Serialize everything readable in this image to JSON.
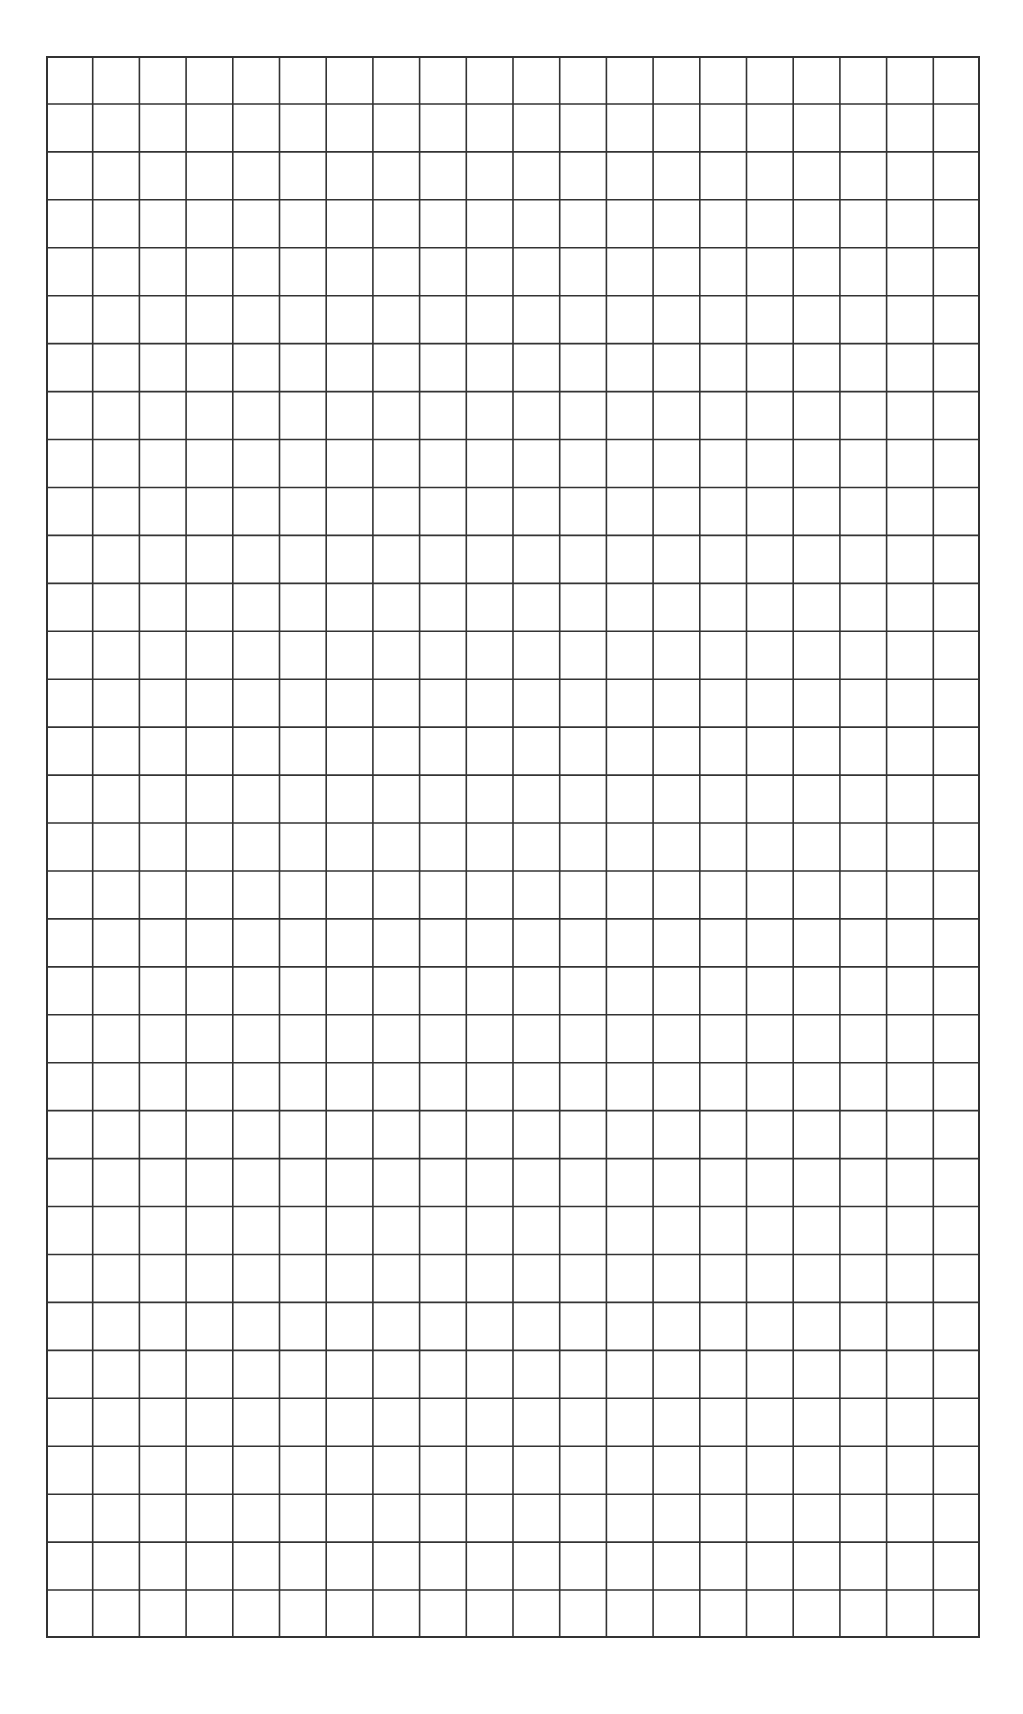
{
  "sheet": {
    "type": "graph-paper",
    "columns": 20,
    "rows": 33,
    "line_color": "#333333",
    "background_color": "#ffffff",
    "grid_left": 46,
    "grid_top": 56,
    "grid_width": 934,
    "grid_height": 1582
  }
}
